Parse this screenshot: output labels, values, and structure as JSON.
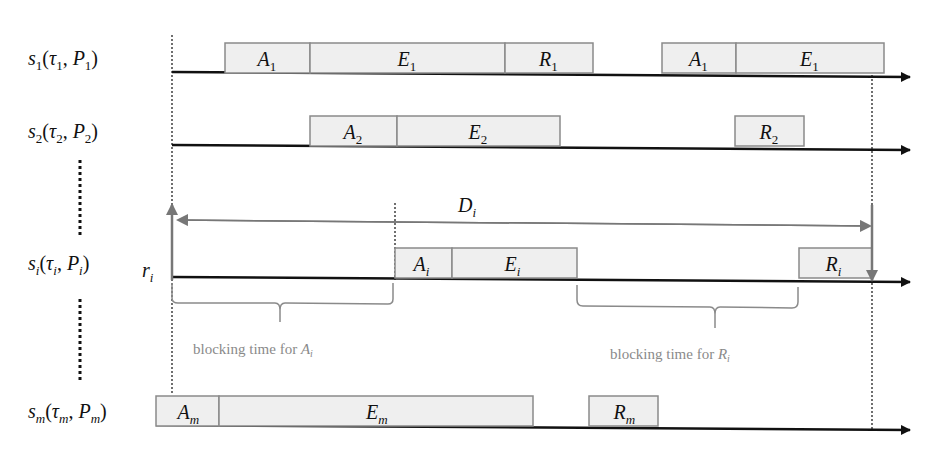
{
  "rows": [
    {
      "id": "s1",
      "label": "s",
      "label_sub": "1",
      "args": [
        "τ",
        "1",
        "P",
        "1"
      ],
      "y": 75,
      "blocks": [
        {
          "label": "A",
          "sub": "1",
          "x": 225,
          "w": 85
        },
        {
          "label": "E",
          "sub": "1",
          "x": 310,
          "w": 195
        },
        {
          "label": "R",
          "sub": "1",
          "x": 505,
          "w": 88
        },
        {
          "label": "A",
          "sub": "1",
          "x": 662,
          "w": 74
        },
        {
          "label": "E",
          "sub": "1",
          "x": 736,
          "w": 148
        }
      ]
    },
    {
      "id": "s2",
      "label": "s",
      "label_sub": "2",
      "args": [
        "τ",
        "2",
        "P",
        "2"
      ],
      "y": 148,
      "blocks": [
        {
          "label": "A",
          "sub": "2",
          "x": 310,
          "w": 87
        },
        {
          "label": "E",
          "sub": "2",
          "x": 397,
          "w": 163
        },
        {
          "label": "R",
          "sub": "2",
          "x": 735,
          "w": 69
        }
      ]
    },
    {
      "id": "si",
      "label": "s",
      "label_sub": "i",
      "args": [
        "τ",
        "i",
        "P",
        "i"
      ],
      "y": 280,
      "blocks": [
        {
          "label": "A",
          "sub": "i",
          "x": 395,
          "w": 57
        },
        {
          "label": "E",
          "sub": "i",
          "x": 452,
          "w": 125
        },
        {
          "label": "R",
          "sub": "i",
          "x": 799,
          "w": 73
        }
      ]
    },
    {
      "id": "sm",
      "label": "s",
      "label_sub": "m",
      "args": [
        "τ",
        "m",
        "P",
        "m"
      ],
      "y": 428,
      "blocks": [
        {
          "label": "A",
          "sub": "m",
          "x": 156,
          "w": 63
        },
        {
          "label": "E",
          "sub": "m",
          "x": 219,
          "w": 314
        },
        {
          "label": "R",
          "sub": "m",
          "x": 589,
          "w": 69
        }
      ]
    }
  ],
  "annotations": {
    "release": {
      "label": "r",
      "sub": "i"
    },
    "deadline": {
      "label": "D",
      "sub": "i"
    },
    "blocking_A": {
      "text": "blocking time for ",
      "var": "A",
      "sub": "i"
    },
    "blocking_R": {
      "text": "blocking time for ",
      "var": "R",
      "sub": "i"
    }
  },
  "colors": {
    "box_fill": "#efefef",
    "box_stroke": "#8a8a8a",
    "axis": "#111111",
    "annotation": "#777777",
    "note_text": "#8a8a8a"
  }
}
